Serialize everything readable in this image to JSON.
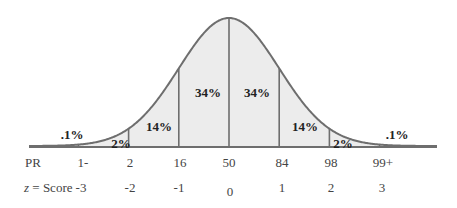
{
  "chart_data": {
    "type": "area",
    "title": "",
    "xlabel": "z = Score",
    "ylabel": "",
    "x": [
      -3,
      -2,
      -1,
      0,
      1,
      2,
      3
    ],
    "z_score_labels": [
      "-3",
      "-2",
      "-1",
      "0",
      "1",
      "2",
      "3"
    ],
    "percentile_rank_labels": [
      "1-",
      "2",
      "16",
      "50",
      "84",
      "98",
      "99+"
    ],
    "segments": [
      {
        "range": "< -3",
        "label": ".1%",
        "value": 0.1
      },
      {
        "range": "-3 to -2",
        "label": "2%",
        "value": 2
      },
      {
        "range": "-2 to -1",
        "label": "14%",
        "value": 14
      },
      {
        "range": "-1 to 0",
        "label": "34%",
        "value": 34
      },
      {
        "range": "0 to 1",
        "label": "34%",
        "value": 34
      },
      {
        "range": "1 to 2",
        "label": "14%",
        "value": 14
      },
      {
        "range": "2 to 3",
        "label": "2%",
        "value": 2
      },
      {
        "range": "> 3",
        "label": ".1%",
        "value": 0.1
      }
    ],
    "grid": false,
    "legend": "none"
  },
  "rows": {
    "pr_label": "PR",
    "z_label_italic": "z",
    "z_label_rest": " = Score"
  },
  "colors": {
    "fill": "#ececec",
    "stroke": "#6e6e6e"
  }
}
